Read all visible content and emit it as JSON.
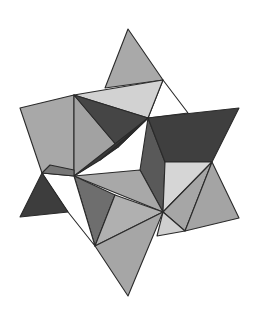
{
  "figure": {
    "title": "Stellated polyhedron (compound of tetrahedra)",
    "background": "#ffffff",
    "stroke": "#2a2a2a",
    "shades": {
      "white": "#ffffff",
      "light": "#d4d4d4",
      "mid_light": "#b3b3b3",
      "mid": "#a2a2a2",
      "mid_dark": "#6e6e6e",
      "dark": "#444444",
      "darkest": "#333333"
    },
    "faces": [
      {
        "name": "top-spike-face",
        "shade": "#a9a9a9",
        "points": "128,29 163,80 105,88"
      },
      {
        "name": "top-right-white-face",
        "shade": "#ffffff",
        "points": "163,80 188,113 148,118"
      },
      {
        "name": "upper-band-light-face",
        "shade": "#d2d2d2",
        "points": "74,95 163,80 148,118"
      },
      {
        "name": "upper-left-spike-face",
        "shade": "#a8a8a8",
        "points": "20,108 74,95 74,176 42,173"
      },
      {
        "name": "left-vertical-face",
        "shade": "#a2a2a2",
        "points": "74,95 118,147 74,176"
      },
      {
        "name": "center-dark-face",
        "shade": "#454545",
        "points": "74,95 148,118 118,147"
      },
      {
        "name": "center-darkest-face",
        "shade": "#333333",
        "points": "148,118 118,147 100,160"
      },
      {
        "name": "center-lower-dark-face",
        "shade": "#3a3a3a",
        "points": "100,160 148,118 74,176"
      },
      {
        "name": "center-vertical-dark-face",
        "shade": "#595959",
        "points": "148,118 140,170 163,212 165,162"
      },
      {
        "name": "right-dark-band-face",
        "shade": "#3f3f3f",
        "points": "148,118 239,108 212,162 165,162"
      },
      {
        "name": "right-light-panel-face",
        "shade": "#d6d6d6",
        "points": "165,162 212,162 163,212"
      },
      {
        "name": "right-mid-face",
        "shade": "#a6a6a6",
        "points": "212,162 163,212 185,231"
      },
      {
        "name": "right-lower-spike-face",
        "shade": "#a4a4a4",
        "points": "212,162 239,218 185,231"
      },
      {
        "name": "right-lower-light-face",
        "shade": "#cfcfcf",
        "points": "163,212 185,231 157,236"
      },
      {
        "name": "center-mid-face",
        "shade": "#a8a8a8",
        "points": "74,176 140,170 163,212"
      },
      {
        "name": "lower-dark-wedge-face",
        "shade": "#6e6e6e",
        "points": "74,176 115,195 95,246"
      },
      {
        "name": "lower-mid-light-face",
        "shade": "#b0b0b0",
        "points": "115,195 163,212 95,246"
      },
      {
        "name": "lower-white-face",
        "shade": "#ffffff",
        "points": "42,173 74,176 95,246 68,212"
      },
      {
        "name": "lower-left-dark-spike-face",
        "shade": "#3d3d3d",
        "points": "42,173 68,212 20,217"
      },
      {
        "name": "bottom-spike-face",
        "shade": "#a6a6a6",
        "points": "95,246 163,212 128,296"
      },
      {
        "name": "left-small-band-face",
        "shade": "#777777",
        "points": "42,173 74,176 74,170 50,165"
      }
    ]
  }
}
